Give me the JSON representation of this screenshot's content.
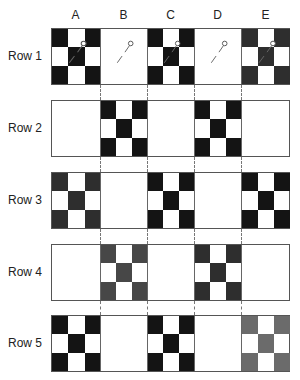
{
  "columns": [
    "A",
    "B",
    "C",
    "D",
    "E"
  ],
  "rows": [
    "Row 1",
    "Row 2",
    "Row 3",
    "Row 4",
    "Row 5"
  ],
  "colors": {
    "black": "#141414",
    "dark_gray": "#2e2e2e",
    "mid_gray": "#474747",
    "light_gray": "#6b6b6b",
    "white": "#ffffff",
    "border": "#555555",
    "connector": "#777777"
  },
  "blocks": [
    {
      "row": "Row 1",
      "col": "A",
      "patterned": true,
      "shade": "black",
      "pin": true
    },
    {
      "row": "Row 1",
      "col": "B",
      "patterned": false,
      "shade": "white",
      "pin": true
    },
    {
      "row": "Row 1",
      "col": "C",
      "patterned": true,
      "shade": "black",
      "pin": true
    },
    {
      "row": "Row 1",
      "col": "D",
      "patterned": false,
      "shade": "white",
      "pin": true
    },
    {
      "row": "Row 1",
      "col": "E",
      "patterned": true,
      "shade": "dark_gray",
      "pin": true
    },
    {
      "row": "Row 2",
      "col": "A",
      "patterned": false,
      "shade": "white",
      "pin": false
    },
    {
      "row": "Row 2",
      "col": "B",
      "patterned": true,
      "shade": "black",
      "pin": false
    },
    {
      "row": "Row 2",
      "col": "C",
      "patterned": false,
      "shade": "white",
      "pin": false
    },
    {
      "row": "Row 2",
      "col": "D",
      "patterned": true,
      "shade": "black",
      "pin": false
    },
    {
      "row": "Row 2",
      "col": "E",
      "patterned": false,
      "shade": "white",
      "pin": false
    },
    {
      "row": "Row 3",
      "col": "A",
      "patterned": true,
      "shade": "dark_gray",
      "pin": false
    },
    {
      "row": "Row 3",
      "col": "B",
      "patterned": false,
      "shade": "white",
      "pin": false
    },
    {
      "row": "Row 3",
      "col": "C",
      "patterned": true,
      "shade": "black",
      "pin": false
    },
    {
      "row": "Row 3",
      "col": "D",
      "patterned": false,
      "shade": "white",
      "pin": false
    },
    {
      "row": "Row 3",
      "col": "E",
      "patterned": true,
      "shade": "black",
      "pin": false
    },
    {
      "row": "Row 4",
      "col": "A",
      "patterned": false,
      "shade": "white",
      "pin": false
    },
    {
      "row": "Row 4",
      "col": "B",
      "patterned": true,
      "shade": "mid_gray",
      "pin": false
    },
    {
      "row": "Row 4",
      "col": "C",
      "patterned": false,
      "shade": "white",
      "pin": false
    },
    {
      "row": "Row 4",
      "col": "D",
      "patterned": true,
      "shade": "dark_gray",
      "pin": false
    },
    {
      "row": "Row 4",
      "col": "E",
      "patterned": false,
      "shade": "white",
      "pin": false
    },
    {
      "row": "Row 5",
      "col": "A",
      "patterned": true,
      "shade": "black",
      "pin": false
    },
    {
      "row": "Row 5",
      "col": "B",
      "patterned": false,
      "shade": "white",
      "pin": false
    },
    {
      "row": "Row 5",
      "col": "C",
      "patterned": true,
      "shade": "black",
      "pin": false
    },
    {
      "row": "Row 5",
      "col": "D",
      "patterned": false,
      "shade": "white",
      "pin": false
    },
    {
      "row": "Row 5",
      "col": "E",
      "patterned": true,
      "shade": "light_gray",
      "pin": false
    }
  ],
  "pattern": "X-shaped nine-patch: four corners and center filled"
}
